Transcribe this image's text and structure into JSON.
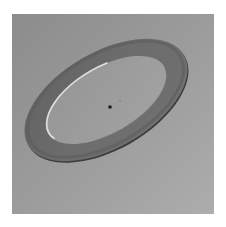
{
  "scene": {
    "description": "Rendered tilted flat ring (annulus) on a gray background with a small dark center point",
    "colors": {
      "page_background": "#ffffff",
      "backdrop_top_left": "#8e8e8e",
      "backdrop_bottom_right": "#ababab",
      "ring_fill": "#6e6e6e",
      "ring_outer_shadow": "#3c3c3c",
      "ring_inner_highlight": "#e6e6e6",
      "inner_disk": "#9c9c9c",
      "center_dot": "#1a1a1a"
    },
    "backdrop": {
      "x": 12,
      "y": 14,
      "width": 202,
      "height": 200
    },
    "ring": {
      "center_x": 106,
      "center_y": 100,
      "outer_rx": 90,
      "outer_ry": 48,
      "inner_rx": 67,
      "inner_ry": 33,
      "rotation_deg": -30
    },
    "center_dot": {
      "x": 110,
      "y": 107,
      "r": 1.8
    }
  }
}
